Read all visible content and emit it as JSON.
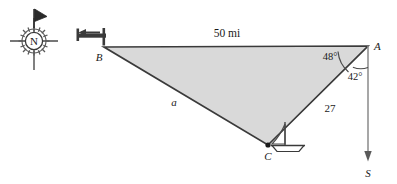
{
  "figure": {
    "type": "geometry-diagram",
    "background_color": "#ffffff",
    "triangle_fill": "#d9d9d9",
    "triangle_stroke": "#3a3a3a",
    "line_color": "#6e6e6e",
    "text_color": "#1a1a1a"
  },
  "compass": {
    "name": "compass-rose",
    "north_label": "N"
  },
  "triangle": {
    "vertices": [
      {
        "id": "A",
        "label": "A",
        "x": 368,
        "y": 46
      },
      {
        "id": "B",
        "label": "B",
        "x": 104,
        "y": 47
      },
      {
        "id": "C",
        "label": "C",
        "x": 268,
        "y": 145
      }
    ],
    "sides": [
      {
        "id": "AB",
        "label": "50 mi"
      },
      {
        "id": "AC",
        "label": "27"
      },
      {
        "id": "BC",
        "label": "a"
      }
    ],
    "angles": [
      {
        "id": "BAC",
        "label": "48°"
      },
      {
        "id": "CAS",
        "label": "42°"
      }
    ]
  },
  "south_ray": {
    "name": "south-direction-ray",
    "label": "S"
  },
  "icons": {
    "ship_at_b": "ship-icon",
    "sailboat_at_c": "sailboat-icon",
    "compass": "compass-rose-icon",
    "north_flag": "north-flag-icon"
  }
}
